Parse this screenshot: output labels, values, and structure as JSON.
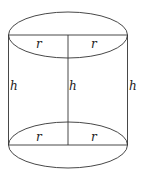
{
  "diagram": {
    "labels": {
      "top_left_radius": "r",
      "top_right_radius": "r",
      "left_height": "h",
      "center_height": "h",
      "right_height": "h",
      "bottom_left_radius": "r",
      "bottom_right_radius": "r"
    },
    "colors": {
      "stroke": "#333333",
      "background": "#ffffff"
    }
  }
}
